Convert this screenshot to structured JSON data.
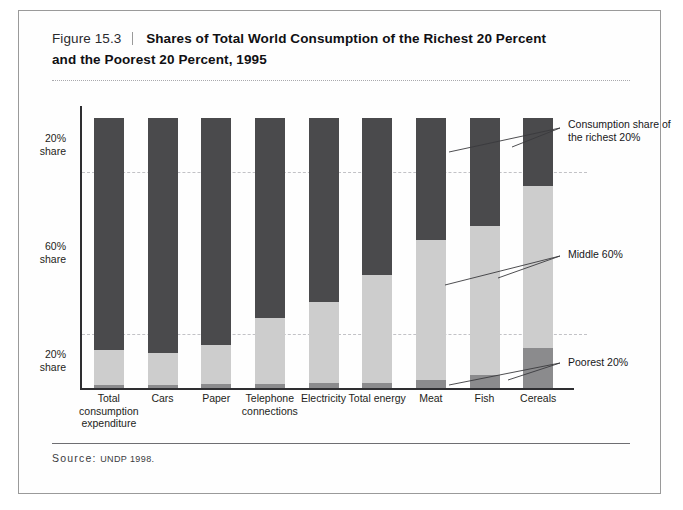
{
  "figure": {
    "label": "Figure 15.3",
    "title_line1": "Shares of Total World Consumption of the Richest 20 Percent",
    "title_line2": "and the Poorest 20 Percent, 1995",
    "source_lead": "Source:",
    "source_value": "UNDP 1998."
  },
  "annotations": {
    "richest": "Consumption share of the richest 20%",
    "middle": "Middle 60%",
    "poorest": "Poorest 20%"
  },
  "colors": {
    "richest": "#4a4a4c",
    "middle": "#cdcdcd",
    "poorest": "#8b8b8d",
    "axis": "#2e2e31",
    "grid": "#c2c2c6"
  },
  "chart_data": {
    "type": "bar",
    "title": "Shares of Total World Consumption of the Richest 20 Percent and the Poorest 20 Percent, 1995",
    "xlabel": "",
    "ylabel": "",
    "ylim": [
      0,
      100
    ],
    "grid": true,
    "stacked": true,
    "legend_position": "right-annotations",
    "ytick_labels": [
      "20% share",
      "60% share",
      "20% share"
    ],
    "ytick_values": [
      90,
      50,
      10
    ],
    "gridline_values": [
      80,
      20
    ],
    "categories": [
      "Total consumption expenditure",
      "Cars",
      "Paper",
      "Telephone connections",
      "Electricity",
      "Total energy",
      "Meat",
      "Fish",
      "Cereals"
    ],
    "series": [
      {
        "name": "Consumption share of the richest 20%",
        "color": "#4a4a4c",
        "values": [
          86,
          87,
          84,
          74,
          68,
          58,
          45,
          40,
          25
        ]
      },
      {
        "name": "Middle 60%",
        "color": "#cdcdcd",
        "values": [
          12.7,
          11.7,
          14.5,
          24.5,
          30,
          40,
          52,
          55,
          60
        ]
      },
      {
        "name": "Poorest 20%",
        "color": "#8b8b8d",
        "values": [
          1.3,
          1.3,
          1.5,
          1.5,
          2,
          2,
          3,
          5,
          15
        ]
      }
    ]
  }
}
